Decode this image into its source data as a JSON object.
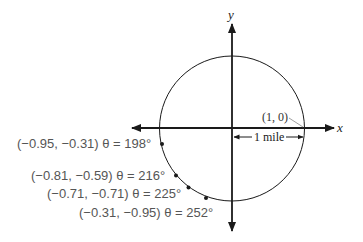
{
  "diagram": {
    "type": "unit-circle",
    "axes": {
      "x_label": "x",
      "y_label": "y"
    },
    "circle": {
      "radius_label": "1 mile",
      "point_label": "(1, 0)"
    },
    "points": [
      {
        "coords": "(−0.95, −0.31)",
        "angle": "θ = 198°",
        "label": "(−0.95, −0.31) θ = 198°"
      },
      {
        "coords": "(−0.81, −0.59)",
        "angle": "θ = 216°",
        "label": "(−0.81, −0.59) θ = 216°"
      },
      {
        "coords": "(−0.71, −0.71)",
        "angle": "θ = 225°",
        "label": "(−0.71, −0.71) θ = 225°"
      },
      {
        "coords": "(−0.31, −0.95)",
        "angle": "θ = 252°",
        "label": "(−0.31, −0.95) θ = 252°"
      }
    ],
    "colors": {
      "stroke": "#1a1a1a",
      "label_text": "#555555"
    }
  }
}
